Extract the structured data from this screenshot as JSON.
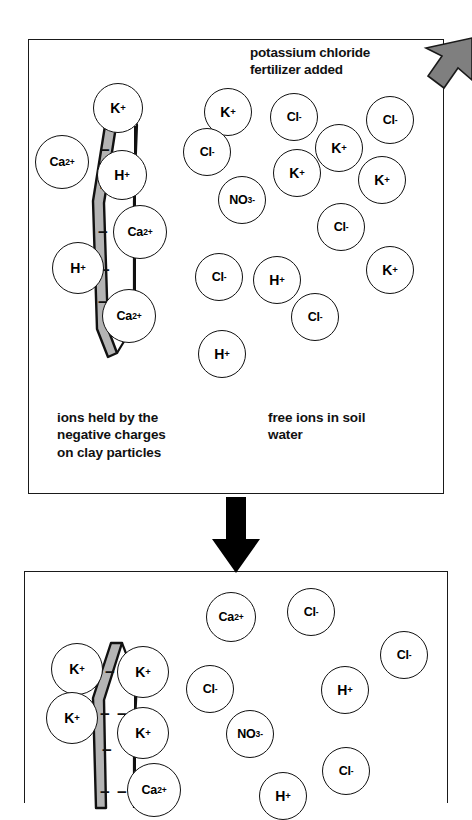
{
  "figure": {
    "colors": {
      "ink": "#111111",
      "clay_fill": "#b4b4b4",
      "arrow_gray": "#7f7f7f",
      "arrow_black": "#000000",
      "panel_background": "#ffffff"
    }
  },
  "annotations": {
    "fertilizer_label_line1": "potassium chloride",
    "fertilizer_label_line2": "fertilizer added",
    "fertilizer_arrow_icon": "thick-arrow-down-left-icon",
    "transition_arrow_icon": "thick-arrow-down-icon"
  },
  "panels": [
    {
      "id": "before",
      "name": "before-fertilizer-panel",
      "captions": {
        "bound_ions": "ions held by the\nnegative charges\non clay particles",
        "bound_ions_lines": [
          "ions held by the",
          "negative charges",
          "on clay particles"
        ],
        "free_ions": "free ions in soil\nwater",
        "free_ions_lines": [
          "free ions in soil",
          "water"
        ]
      },
      "clay_particle": {
        "label": "clay-particle",
        "negative_charge_symbol": "−",
        "negative_charge_count": 9
      },
      "bound_ions": [
        {
          "species": "K",
          "charge": "+",
          "label": "K+",
          "x": 118,
          "y": 108,
          "r": 25
        },
        {
          "species": "Ca",
          "charge": "2+",
          "label": "Ca2+",
          "x": 62,
          "y": 162,
          "r": 27
        },
        {
          "species": "H",
          "charge": "+",
          "label": "H+",
          "x": 122,
          "y": 175,
          "r": 25
        },
        {
          "species": "Ca",
          "charge": "2+",
          "label": "Ca2+",
          "x": 140,
          "y": 232,
          "r": 27
        },
        {
          "species": "H",
          "charge": "+",
          "label": "H+",
          "x": 78,
          "y": 268,
          "r": 26
        },
        {
          "species": "Ca",
          "charge": "2+",
          "label": "Ca2+",
          "x": 129,
          "y": 316,
          "r": 27
        }
      ],
      "free_ions": [
        {
          "species": "K",
          "charge": "+",
          "label": "K+",
          "x": 228,
          "y": 112,
          "r": 24
        },
        {
          "species": "Cl",
          "charge": "-",
          "label": "Cl-",
          "x": 294,
          "y": 117,
          "r": 24
        },
        {
          "species": "Cl",
          "charge": "-",
          "label": "Cl-",
          "x": 390,
          "y": 120,
          "r": 24
        },
        {
          "species": "Cl",
          "charge": "-",
          "label": "Cl-",
          "x": 207,
          "y": 152,
          "r": 24
        },
        {
          "species": "K",
          "charge": "+",
          "label": "K+",
          "x": 339,
          "y": 148,
          "r": 24
        },
        {
          "species": "K",
          "charge": "+",
          "label": "K+",
          "x": 297,
          "y": 173,
          "r": 24
        },
        {
          "species": "K",
          "charge": "+",
          "label": "K+",
          "x": 382,
          "y": 180,
          "r": 24
        },
        {
          "species": "NO3",
          "charge": "-",
          "label": "NO3-",
          "x": 242,
          "y": 200,
          "r": 24
        },
        {
          "species": "Cl",
          "charge": "-",
          "label": "Cl-",
          "x": 341,
          "y": 227,
          "r": 24
        },
        {
          "species": "Cl",
          "charge": "-",
          "label": "Cl-",
          "x": 219,
          "y": 277,
          "r": 24
        },
        {
          "species": "H",
          "charge": "+",
          "label": "H+",
          "x": 277,
          "y": 280,
          "r": 24
        },
        {
          "species": "K",
          "charge": "+",
          "label": "K+",
          "x": 390,
          "y": 270,
          "r": 24
        },
        {
          "species": "Cl",
          "charge": "-",
          "label": "Cl-",
          "x": 315,
          "y": 317,
          "r": 24
        },
        {
          "species": "H",
          "charge": "+",
          "label": "H+",
          "x": 222,
          "y": 354,
          "r": 24
        }
      ]
    },
    {
      "id": "after",
      "name": "after-fertilizer-panel",
      "clay_particle": {
        "label": "clay-particle",
        "negative_charge_symbol": "−",
        "negative_charge_count": 7
      },
      "bound_ions": [
        {
          "species": "K",
          "charge": "+",
          "label": "K+",
          "x": 77,
          "y": 669,
          "r": 26
        },
        {
          "species": "K",
          "charge": "+",
          "label": "K+",
          "x": 143,
          "y": 672,
          "r": 26
        },
        {
          "species": "K",
          "charge": "+",
          "label": "K+",
          "x": 72,
          "y": 718,
          "r": 26
        },
        {
          "species": "K",
          "charge": "+",
          "label": "K+",
          "x": 143,
          "y": 733,
          "r": 26
        },
        {
          "species": "Ca",
          "charge": "2+",
          "label": "Ca2+",
          "x": 154,
          "y": 790,
          "r": 27
        }
      ],
      "free_ions": [
        {
          "species": "Ca",
          "charge": "2+",
          "label": "Ca2+",
          "x": 231,
          "y": 617,
          "r": 25
        },
        {
          "species": "Cl",
          "charge": "-",
          "label": "Cl-",
          "x": 311,
          "y": 612,
          "r": 24
        },
        {
          "species": "Cl",
          "charge": "-",
          "label": "Cl-",
          "x": 404,
          "y": 655,
          "r": 24
        },
        {
          "species": "Cl",
          "charge": "-",
          "label": "Cl-",
          "x": 210,
          "y": 689,
          "r": 24
        },
        {
          "species": "H",
          "charge": "+",
          "label": "H+",
          "x": 345,
          "y": 690,
          "r": 24
        },
        {
          "species": "NO3",
          "charge": "-",
          "label": "NO3-",
          "x": 250,
          "y": 734,
          "r": 24
        },
        {
          "species": "Cl",
          "charge": "-",
          "label": "Cl-",
          "x": 346,
          "y": 771,
          "r": 24
        },
        {
          "species": "H",
          "charge": "+",
          "label": "H+",
          "x": 283,
          "y": 796,
          "r": 24
        }
      ]
    }
  ],
  "chart_data": {
    "type": "diagram",
    "stages": [
      {
        "stage": "before",
        "bound_ion_counts": {
          "K+": 1,
          "Ca2+": 3,
          "H+": 2
        },
        "free_ion_counts": {
          "K+": 4,
          "Cl-": 5,
          "H+": 2,
          "NO3-": 1
        }
      },
      {
        "stage": "after",
        "bound_ion_counts": {
          "K+": 4,
          "Ca2+": 1,
          "H+": 0
        },
        "free_ion_counts": {
          "Cl-": 4,
          "H+": 2,
          "Ca2+": 1,
          "NO3-": 1
        }
      }
    ]
  }
}
